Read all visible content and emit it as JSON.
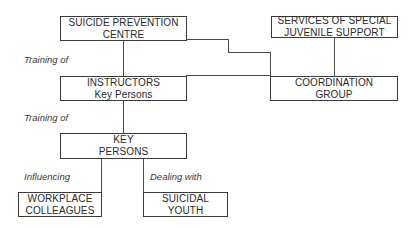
{
  "diagram": {
    "nodes": {
      "spc": {
        "line1": "SUICIDE PREVENTION",
        "line2": "CENTRE"
      },
      "services": {
        "line1": "SERVICES OF SPECIAL",
        "line2": "JUVENILE SUPPORT"
      },
      "instructors": {
        "line1": "INSTRUCTORS",
        "line2": "Key Persons"
      },
      "coordination": {
        "line1": "COORDINATION",
        "line2": "GROUP"
      },
      "key_persons": {
        "line1": "KEY",
        "line2": "PERSONS"
      },
      "workplace": {
        "line1": "WORKPLACE",
        "line2": "COLLEAGUES"
      },
      "youth": {
        "line1": "SUICIDAL",
        "line2": "YOUTH"
      }
    },
    "edge_labels": {
      "training_1": "Training of",
      "training_2": "Training of",
      "influencing": "Influencing",
      "dealing": "Dealing with"
    }
  }
}
